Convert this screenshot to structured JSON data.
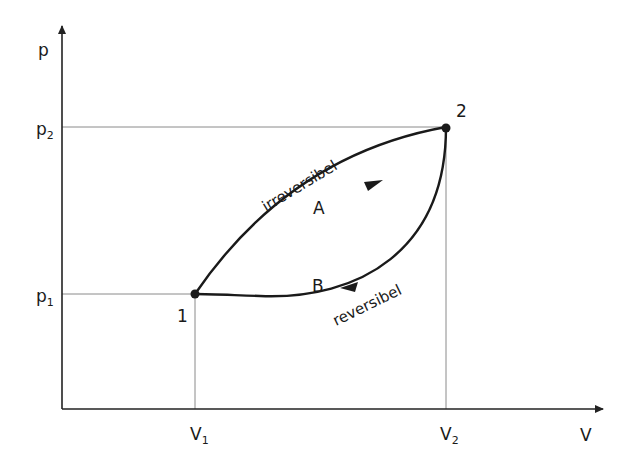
{
  "diagram": {
    "type": "p-V diagram",
    "axes": {
      "y_label": "p",
      "x_label": "V",
      "y_ticks": [
        {
          "label": "p",
          "sub": "2",
          "name": "p2"
        },
        {
          "label": "p",
          "sub": "1",
          "name": "p1"
        }
      ],
      "x_ticks": [
        {
          "label": "V",
          "sub": "1",
          "name": "V1"
        },
        {
          "label": "V",
          "sub": "2",
          "name": "V2"
        }
      ]
    },
    "points": [
      {
        "label": "1",
        "at": "V1, p1"
      },
      {
        "label": "2",
        "at": "V2, p2"
      }
    ],
    "paths": [
      {
        "id": "A",
        "label": "A",
        "description": "irreversibel",
        "from": "1",
        "to": "2"
      },
      {
        "id": "B",
        "label": "B",
        "description": "reversibel",
        "from": "2",
        "to": "1"
      }
    ],
    "colors": {
      "line": "#1a1a1a",
      "guide": "#8a8a8a"
    }
  }
}
